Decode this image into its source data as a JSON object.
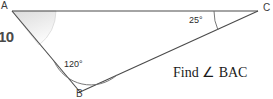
{
  "figure": {
    "type": "triangle-geometry-problem",
    "background_color": "#ffffff",
    "stroke_color": "#4a4a4a",
    "shade_color": "#e8e8e8",
    "vertices": {
      "a": {
        "label": "A",
        "x": 12,
        "y": 11
      },
      "b": {
        "label": "B",
        "x": 80,
        "y": 92
      },
      "c": {
        "label": "C",
        "x": 258,
        "y": 11
      }
    },
    "angles": {
      "at_c": {
        "value": "25",
        "label": "25°"
      },
      "at_b": {
        "value": "120",
        "label": "120°"
      },
      "at_a": {
        "label": "",
        "shaded": true
      }
    },
    "side_length": {
      "label": "10"
    },
    "prompt": {
      "text": "Find ∠ BAC"
    }
  }
}
